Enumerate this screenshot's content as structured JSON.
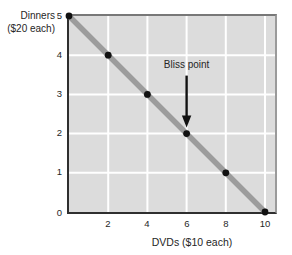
{
  "figure": {
    "y_axis_title_line1": "Dinners",
    "y_axis_title_line2": "($20 each)",
    "x_axis_title": "DVDs ($10 each)",
    "annotation_label": "Bliss point"
  },
  "chart_data": {
    "type": "line",
    "title": "",
    "xlabel": "DVDs ($10 each)",
    "ylabel": "Dinners ($20 each)",
    "points": [
      [
        0,
        5
      ],
      [
        2,
        4
      ],
      [
        4,
        3
      ],
      [
        6,
        2
      ],
      [
        8,
        1
      ],
      [
        10,
        0
      ]
    ],
    "xlim": [
      0,
      10.7
    ],
    "ylim": [
      0,
      5
    ],
    "x_tick_labels": [
      "2",
      "4",
      "6",
      "8",
      "10"
    ],
    "y_tick_labels": [
      "5",
      "4",
      "3",
      "2",
      "1",
      "0"
    ],
    "x_gridlines": [
      2,
      4,
      6,
      8,
      10
    ],
    "y_gridlines": [
      1,
      2,
      3,
      4
    ],
    "grid": true,
    "legend": false,
    "annotations": [
      {
        "text": "Bliss point",
        "x": 6,
        "y": 2,
        "arrow": "down"
      }
    ],
    "colors": {
      "plot_bg": "#dcdcdc",
      "gridline": "#ffffff",
      "budget_line": "#9c9c9c",
      "point": "#111111",
      "annotation": "#111111",
      "axis": "#2f2f2f",
      "frame": "#8a8a8a",
      "text": "#262626"
    }
  }
}
